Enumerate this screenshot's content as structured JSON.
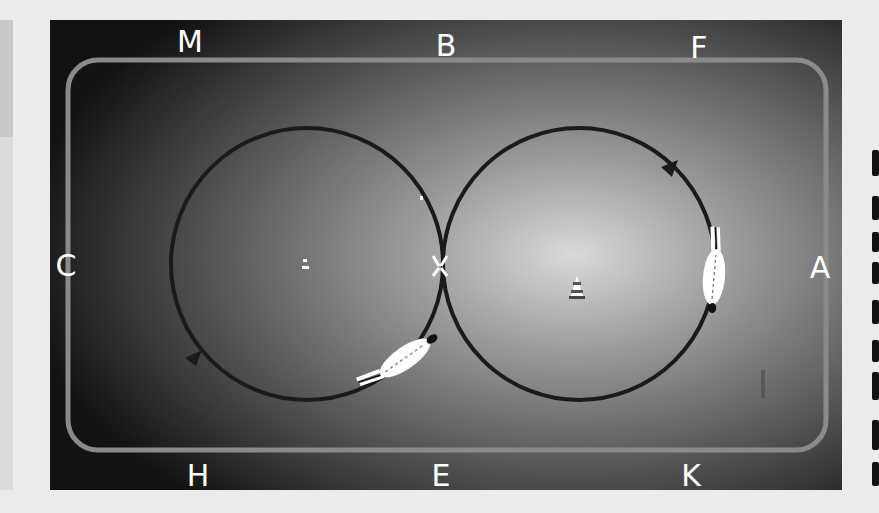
{
  "diagram": {
    "arena": {
      "background_center": "#d8d8d8",
      "background_edge": "#141414",
      "track_color": "#8a8a8a",
      "path_color": "#1a1a1a"
    },
    "letters": {
      "top": [
        "M",
        "B",
        "F"
      ],
      "bottom": [
        "H",
        "E",
        "K"
      ],
      "left": "C",
      "right": "A",
      "center": "X"
    },
    "circles": [
      {
        "name": "left-circle",
        "direction": "counter-clockwise",
        "rider_position": "lower-right"
      },
      {
        "name": "right-circle",
        "direction": "counter-clockwise",
        "rider_position": "right"
      }
    ],
    "markers": [
      "left-cone",
      "right-cone"
    ]
  }
}
